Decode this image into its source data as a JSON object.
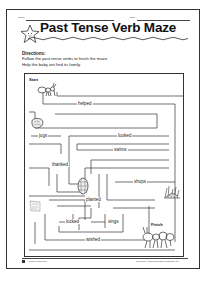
{
  "header": {
    "name_label": "Name",
    "date_label": "Date",
    "title": "Past Tense Verb Maze"
  },
  "directions": {
    "heading": "Directions:",
    "line1": "Follow the past tense verbs to finish the maze.",
    "line2": "Help the baby ant find its family."
  },
  "maze": {
    "start_label": "Start",
    "finish_label": "Finish",
    "words": [
      {
        "text": "helped"
      },
      {
        "text": "jogs"
      },
      {
        "text": "looked"
      },
      {
        "text": "swims"
      },
      {
        "text": "thanked"
      },
      {
        "text": "shops"
      },
      {
        "text": "planted"
      },
      {
        "text": "locked"
      },
      {
        "text": "sings"
      },
      {
        "text": "wished"
      }
    ],
    "icons": [
      "baby-ant-icon",
      "rock-icon",
      "pinecone-icon",
      "grass-icon",
      "leaf-icon",
      "ant-family-icon"
    ]
  },
  "footer": {
    "page_number": "18",
    "left_text": "Verbs of Speech",
    "right_text": "Copyright © 2005 Scholastic Publishing, Inc."
  },
  "colors": {
    "ink": "#222222",
    "paper": "#ffffff"
  }
}
